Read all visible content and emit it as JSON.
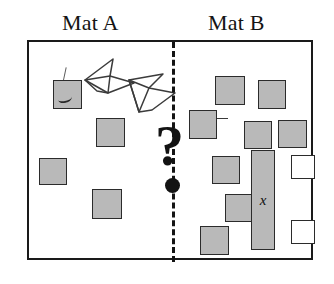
{
  "figure": {
    "labels": {
      "mat_a": "Mat A",
      "mat_b": "Mat B"
    },
    "divider": {
      "style": "dashed",
      "orientation": "vertical",
      "color": "#141414"
    },
    "center_marker": {
      "glyph": "?",
      "color": "#131313",
      "dot_color": "#131313"
    },
    "colors": {
      "gray_fill": "#b9b9b9",
      "white_fill": "#ffffff",
      "stroke": "#2b2b2b",
      "frame": "#1a1a1a"
    },
    "bar_label": "x",
    "mat_a": {
      "squares": [
        {
          "name": "square-marked",
          "x": 24,
          "y": 38,
          "w": 29,
          "h": 29,
          "fill": "gray",
          "marked": true
        },
        {
          "name": "square-a2",
          "x": 67,
          "y": 76,
          "w": 29,
          "h": 29,
          "fill": "gray",
          "marked": false
        },
        {
          "name": "square-a3",
          "x": 10,
          "y": 116,
          "w": 28,
          "h": 27,
          "fill": "gray",
          "marked": false
        },
        {
          "name": "square-a4",
          "x": 63,
          "y": 147,
          "w": 30,
          "h": 30,
          "fill": "gray",
          "marked": false
        }
      ],
      "doodles": [
        {
          "name": "dart-upper-left"
        },
        {
          "name": "dart-lower-right"
        }
      ]
    },
    "mat_b": {
      "squares": [
        {
          "name": "square-b1",
          "x": 186,
          "y": 34,
          "w": 30,
          "h": 29,
          "fill": "gray",
          "tick": false
        },
        {
          "name": "square-b2",
          "x": 229,
          "y": 38,
          "w": 28,
          "h": 29,
          "fill": "gray",
          "tick": false
        },
        {
          "name": "square-b3",
          "x": 160,
          "y": 68,
          "w": 28,
          "h": 29,
          "fill": "gray",
          "tick": true
        },
        {
          "name": "square-b4",
          "x": 215,
          "y": 79,
          "w": 28,
          "h": 28,
          "fill": "gray",
          "tick": false
        },
        {
          "name": "square-b5",
          "x": 249,
          "y": 78,
          "w": 29,
          "h": 28,
          "fill": "gray",
          "tick": false
        },
        {
          "name": "square-b6",
          "x": 183,
          "y": 114,
          "w": 28,
          "h": 28,
          "fill": "gray",
          "tick": false
        },
        {
          "name": "square-b7",
          "x": 196,
          "y": 152,
          "w": 27,
          "h": 28,
          "fill": "gray",
          "tick": false
        },
        {
          "name": "square-b8",
          "x": 171,
          "y": 184,
          "w": 29,
          "h": 29,
          "fill": "gray",
          "tick": false
        },
        {
          "name": "square-b9",
          "x": 255,
          "y": 111,
          "w": 0,
          "h": 0,
          "fill": "none",
          "tick": false
        }
      ],
      "white_squares": [
        {
          "name": "white-square-upper",
          "x": 262,
          "y": 113,
          "w": 24,
          "h": 24
        },
        {
          "name": "white-square-lower",
          "x": 262,
          "y": 178,
          "w": 24,
          "h": 24
        }
      ],
      "bar": {
        "name": "bar-x",
        "x": 222,
        "y": 108,
        "w": 24,
        "h": 100,
        "fill": "gray",
        "label": "x"
      }
    }
  }
}
